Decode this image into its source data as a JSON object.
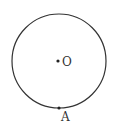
{
  "diagram": {
    "type": "circle",
    "center": {
      "label": "O",
      "x": 59,
      "y": 61
    },
    "radius": 47,
    "points": [
      {
        "label": "A",
        "x": 59,
        "y": 108,
        "position": "on circle, bottom"
      }
    ],
    "colors": {
      "stroke": "#333333",
      "background": "#ffffff"
    }
  }
}
